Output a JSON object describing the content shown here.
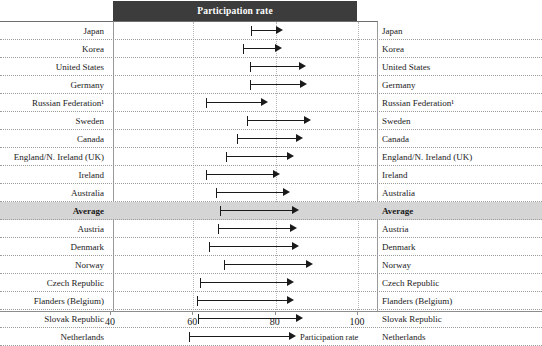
{
  "header": {
    "banner_title": "Participation rate"
  },
  "axis": {
    "title": "Participation rate",
    "ticks": [
      40,
      60,
      80,
      100
    ],
    "tick_labels": [
      "40",
      "60",
      "80",
      "100"
    ],
    "min": 36,
    "max": 101
  },
  "colors": {
    "banner_bg": "#3c3c3c",
    "banner_text": "#ffffff",
    "arrow": "#1a1a1a",
    "average_row_bg": "#d5d5d5",
    "gridline": "#b9b9b9",
    "axis": "#8d8d8d"
  },
  "chart_data": {
    "type": "bar",
    "title": "Participation rate",
    "xlabel": "Participation rate",
    "ylabel": "",
    "xlim": [
      36,
      101
    ],
    "grid": true,
    "legend_position": "none",
    "note": "Horizontal arrow ranges: start cap = lower participation rate, arrow head = upper participation rate",
    "categories": [
      "Japan",
      "Korea",
      "United States",
      "Germany",
      "Russian Federation¹",
      "Sweden",
      "Canada",
      "England/N. Ireland (UK)",
      "Ireland",
      "Australia",
      "Average",
      "Austria",
      "Denmark",
      "Norway",
      "Czech Republic",
      "Flanders (Belgium)",
      "Slovak Republic",
      "Netherlands",
      "Estonia",
      "Poland",
      "Finland"
    ],
    "series": [
      {
        "name": "Lower value (start)",
        "values": [
          74.3,
          72.4,
          74.1,
          74.1,
          63.2,
          73.2,
          70.9,
          68.2,
          63.3,
          65.8,
          66.7,
          66.2,
          64.1,
          67.6,
          61.9,
          61.1,
          61.4,
          59.3,
          65.2,
          59.8,
          58.9
        ]
      },
      {
        "name": "Upper value (arrow head)",
        "values": [
          82.1,
          81.9,
          87.6,
          87.8,
          78.3,
          88.8,
          86.8,
          84.6,
          81.3,
          83.7,
          85.9,
          85.5,
          85.9,
          89.2,
          84.6,
          84.6,
          87.0,
          85.1,
          91.0,
          86.3,
          86.2
        ]
      }
    ],
    "highlight_category": "Average"
  }
}
